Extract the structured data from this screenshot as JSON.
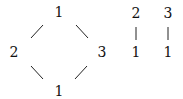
{
  "diagrams": [
    {
      "name": "diamond-poset",
      "nodes": [
        {
          "id": "top",
          "label": "1"
        },
        {
          "id": "left",
          "label": "2"
        },
        {
          "id": "right",
          "label": "3"
        },
        {
          "id": "bottom",
          "label": "1"
        }
      ],
      "edges": [
        {
          "from": "left",
          "to": "top"
        },
        {
          "from": "top",
          "to": "right"
        },
        {
          "from": "left",
          "to": "bottom"
        },
        {
          "from": "bottom",
          "to": "right"
        }
      ]
    },
    {
      "name": "chain-2-1",
      "nodes": [
        {
          "id": "upper",
          "label": "2"
        },
        {
          "id": "lower",
          "label": "1"
        }
      ],
      "edges": [
        {
          "from": "upper",
          "to": "lower"
        }
      ]
    },
    {
      "name": "chain-3-1",
      "nodes": [
        {
          "id": "upper",
          "label": "3"
        },
        {
          "id": "lower",
          "label": "1"
        }
      ],
      "edges": [
        {
          "from": "upper",
          "to": "lower"
        }
      ]
    }
  ]
}
